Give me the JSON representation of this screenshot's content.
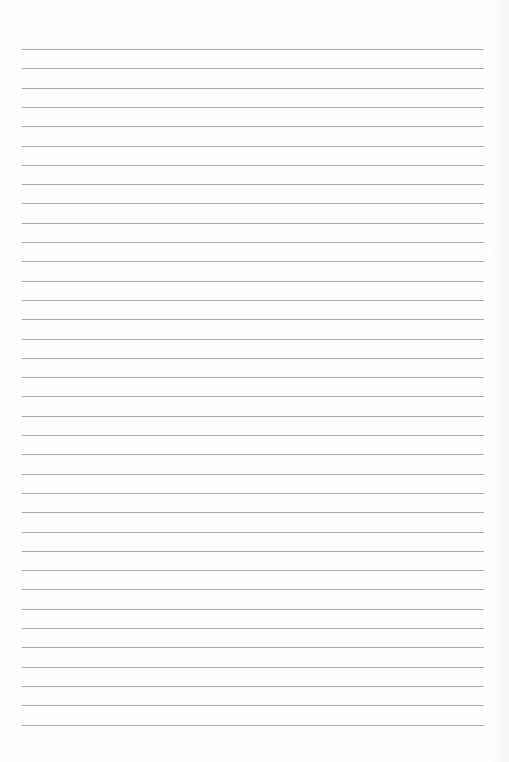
{
  "page": {
    "type": "blank-lined-paper",
    "background_color": "#fefefe",
    "line_color": "#9a9a9a",
    "line_count": 36,
    "first_line_y": 49,
    "line_spacing": 19.3,
    "line_left": 22,
    "line_right": 484,
    "text": []
  }
}
